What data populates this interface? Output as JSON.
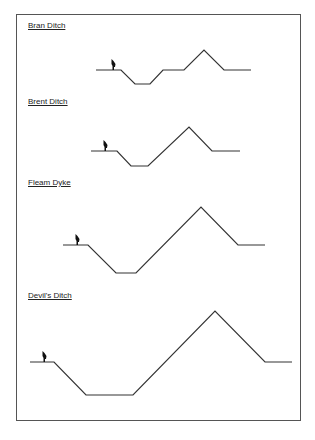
{
  "diagram": {
    "type": "cross-section profiles",
    "sections": [
      {
        "name": "Bran Ditch",
        "label_y": 27,
        "person_x": 113,
        "ground_y": 70,
        "points": [
          [
            96,
            70
          ],
          [
            121,
            70
          ],
          [
            135,
            84
          ],
          [
            150,
            84
          ],
          [
            163,
            70
          ],
          [
            184,
            70
          ],
          [
            204,
            50
          ],
          [
            224,
            70
          ],
          [
            251,
            70
          ]
        ]
      },
      {
        "name": "Brent Ditch",
        "label_y": 103,
        "person_x": 105,
        "ground_y": 151,
        "points": [
          [
            91,
            151
          ],
          [
            117,
            151
          ],
          [
            131,
            166
          ],
          [
            148,
            166
          ],
          [
            189,
            127
          ],
          [
            212,
            151
          ],
          [
            240,
            151
          ]
        ]
      },
      {
        "name": "Fleam Dyke",
        "label_y": 184,
        "person_x": 77,
        "ground_y": 245,
        "points": [
          [
            63,
            245
          ],
          [
            88,
            245
          ],
          [
            116,
            273
          ],
          [
            136,
            273
          ],
          [
            201,
            207
          ],
          [
            238,
            245
          ],
          [
            265,
            245
          ]
        ]
      },
      {
        "name": "Devil's Ditch",
        "label_y": 297,
        "person_x": 44,
        "ground_y": 362,
        "points": [
          [
            30,
            362
          ],
          [
            54,
            362
          ],
          [
            86,
            395
          ],
          [
            133,
            395
          ],
          [
            215,
            311
          ],
          [
            265,
            362
          ],
          [
            292,
            362
          ]
        ]
      }
    ],
    "line_color": "#333333",
    "person_color": "#111111"
  }
}
